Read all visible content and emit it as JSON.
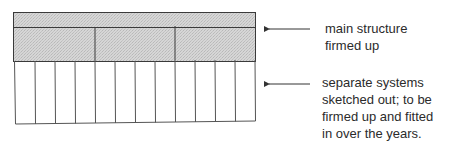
{
  "diagram": {
    "type": "layered-structure",
    "colors": {
      "stroke": "#3a3a3a",
      "shaded_fill": "#cfcfcf",
      "background": "#ffffff",
      "text": "#2b2b2b"
    },
    "layers": [
      {
        "id": "top-band",
        "shaded": true,
        "sections": 1
      },
      {
        "id": "middle-band",
        "shaded": true,
        "sections": 3
      },
      {
        "id": "bottom-band",
        "shaded": false,
        "sections": 12
      }
    ],
    "annotations": [
      {
        "id": "main-structure",
        "points_to": "shaded upper layers",
        "lines": [
          "main structure",
          "firmed up"
        ]
      },
      {
        "id": "separate-systems",
        "points_to": "unshaded lower columns",
        "lines": [
          "separate systems",
          "sketched out; to be",
          "firmed up and fitted",
          "in over the years."
        ]
      }
    ]
  }
}
